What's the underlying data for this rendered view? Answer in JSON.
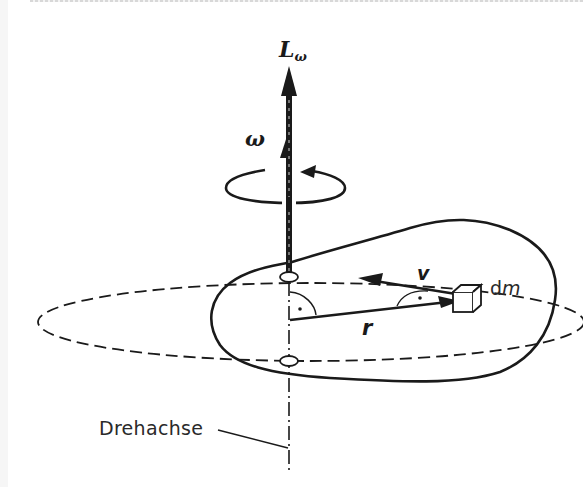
{
  "figure": {
    "type": "physics-diagram",
    "colors": {
      "ink": "#1a1a1a",
      "background": "#ffffff"
    }
  },
  "labels": {
    "angular_momentum": "L",
    "angular_momentum_subscript": "ω",
    "angular_velocity": "ω",
    "velocity": "v",
    "radius": "r",
    "mass_element_d": "d",
    "mass_element_m": "m",
    "axis": "Drehachse"
  },
  "elements": [
    {
      "name": "rotation-axis",
      "style": "dash-dot vertical line"
    },
    {
      "name": "angular-momentum-vector",
      "label": "L_ω",
      "direction": "up along axis"
    },
    {
      "name": "angular-velocity-vector",
      "label": "ω",
      "direction": "up along axis"
    },
    {
      "name": "rotation-sense-arrow",
      "style": "circular arrow around axis"
    },
    {
      "name": "rigid-body-outline",
      "style": "solid irregular closed curve"
    },
    {
      "name": "orbit-ellipse",
      "style": "dashed ellipse, path of dm"
    },
    {
      "name": "radius-vector",
      "label": "r",
      "from": "axis",
      "to": "dm"
    },
    {
      "name": "velocity-vector",
      "label": "v",
      "from": "dm",
      "direction": "tangential"
    },
    {
      "name": "mass-element",
      "label": "dm",
      "shape": "small cube"
    },
    {
      "name": "right-angle-marks",
      "count": 2
    }
  ]
}
